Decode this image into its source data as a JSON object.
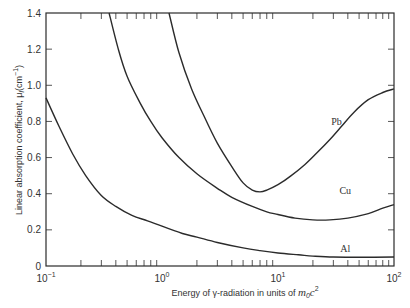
{
  "chart_data": {
    "type": "line",
    "title": "",
    "xlabel": "Energy of γ-radiation in units of m0c²",
    "xlabel_parts": {
      "main": "Energy of γ-radiation in units of ",
      "sym": "m",
      "sub": "0",
      "sym2": "c",
      "sup": "2"
    },
    "ylabel": "Linear absorption coefficient, μl (cm⁻¹)",
    "ylabel_parts": {
      "main": "Linear absorption coefficient, μ",
      "sub": "l",
      "unit": "(cm",
      "sup": "−1",
      "close": ")"
    },
    "xscale": "log",
    "xlim": [
      0.1,
      100
    ],
    "ylim": [
      0,
      1.4
    ],
    "x_ticks": [
      {
        "value": 0.1,
        "base": "10",
        "exp": "−1"
      },
      {
        "value": 1,
        "base": "10",
        "exp": "0"
      },
      {
        "value": 10,
        "base": "10",
        "exp": "1"
      },
      {
        "value": 100,
        "base": "10",
        "exp": "2"
      }
    ],
    "y_ticks": [
      {
        "value": 0,
        "label": "0"
      },
      {
        "value": 0.2,
        "label": "0.2"
      },
      {
        "value": 0.4,
        "label": "0.4"
      },
      {
        "value": 0.6,
        "label": "0.6"
      },
      {
        "value": 0.8,
        "label": "0.8"
      },
      {
        "value": 1.0,
        "label": "1.0"
      },
      {
        "value": 1.2,
        "label": "1.2"
      },
      {
        "value": 1.4,
        "label": "1.4"
      }
    ],
    "grid": false,
    "legend": "inline labels",
    "series": [
      {
        "name": "Pb",
        "label_pos": {
          "x": 32,
          "y": 0.78
        },
        "points": [
          [
            1.15,
            1.4
          ],
          [
            1.4,
            1.18
          ],
          [
            1.8,
            0.98
          ],
          [
            2.3,
            0.83
          ],
          [
            3.0,
            0.68
          ],
          [
            4.0,
            0.55
          ],
          [
            5.0,
            0.46
          ],
          [
            6.0,
            0.42
          ],
          [
            7.0,
            0.41
          ],
          [
            8.0,
            0.42
          ],
          [
            10,
            0.45
          ],
          [
            13,
            0.5
          ],
          [
            17,
            0.56
          ],
          [
            22,
            0.63
          ],
          [
            28,
            0.7
          ],
          [
            35,
            0.77
          ],
          [
            45,
            0.85
          ],
          [
            60,
            0.92
          ],
          [
            80,
            0.96
          ],
          [
            100,
            0.98
          ]
        ]
      },
      {
        "name": "Cu",
        "label_pos": {
          "x": 38,
          "y": 0.4
        },
        "points": [
          [
            0.35,
            1.4
          ],
          [
            0.42,
            1.2
          ],
          [
            0.5,
            1.05
          ],
          [
            0.65,
            0.9
          ],
          [
            0.8,
            0.8
          ],
          [
            1.0,
            0.71
          ],
          [
            1.4,
            0.6
          ],
          [
            2.0,
            0.51
          ],
          [
            3.0,
            0.43
          ],
          [
            4.0,
            0.38
          ],
          [
            6.0,
            0.33
          ],
          [
            8.0,
            0.3
          ],
          [
            10,
            0.285
          ],
          [
            14,
            0.265
          ],
          [
            20,
            0.255
          ],
          [
            28,
            0.255
          ],
          [
            40,
            0.265
          ],
          [
            60,
            0.29
          ],
          [
            80,
            0.32
          ],
          [
            100,
            0.34
          ]
        ]
      },
      {
        "name": "Al",
        "label_pos": {
          "x": 38,
          "y": 0.08
        },
        "points": [
          [
            0.1,
            0.93
          ],
          [
            0.13,
            0.77
          ],
          [
            0.17,
            0.62
          ],
          [
            0.22,
            0.5
          ],
          [
            0.3,
            0.39
          ],
          [
            0.4,
            0.33
          ],
          [
            0.55,
            0.28
          ],
          [
            0.75,
            0.25
          ],
          [
            1.0,
            0.22
          ],
          [
            1.5,
            0.18
          ],
          [
            2.0,
            0.16
          ],
          [
            3.0,
            0.13
          ],
          [
            5.0,
            0.1
          ],
          [
            7.0,
            0.085
          ],
          [
            10,
            0.072
          ],
          [
            15,
            0.062
          ],
          [
            20,
            0.055
          ],
          [
            30,
            0.05
          ],
          [
            50,
            0.048
          ],
          [
            100,
            0.05
          ]
        ]
      }
    ]
  }
}
